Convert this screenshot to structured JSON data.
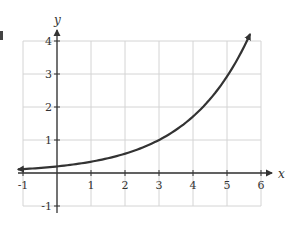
{
  "chart_data": {
    "type": "line",
    "title": "",
    "xlabel": "x",
    "ylabel": "y",
    "xlim": [
      -1,
      6
    ],
    "ylim": [
      -1,
      4
    ],
    "grid": true,
    "legend": null,
    "x_ticks": [
      -1,
      1,
      2,
      3,
      4,
      5,
      6
    ],
    "y_ticks": [
      -1,
      1,
      2,
      3,
      4
    ],
    "x_tick_labels": [
      "-1",
      "1",
      "2",
      "3",
      "4",
      "5",
      "6"
    ],
    "y_tick_labels": [
      "-1",
      "1",
      "2",
      "3",
      "4"
    ],
    "series": [
      {
        "name": "exponential curve",
        "function": "y = 0.2 * 5^(x/3)",
        "x": [
          -1,
          0,
          1,
          2,
          3,
          4,
          5,
          5.6
        ],
        "y": [
          0.12,
          0.2,
          0.34,
          0.58,
          1.0,
          1.71,
          2.92,
          4.0
        ],
        "left_end": "arrow",
        "right_end": "arrow",
        "color": "#333333"
      }
    ]
  },
  "colors": {
    "grid": "#d4d4d4",
    "axis": "#333333",
    "curve": "#333333"
  }
}
